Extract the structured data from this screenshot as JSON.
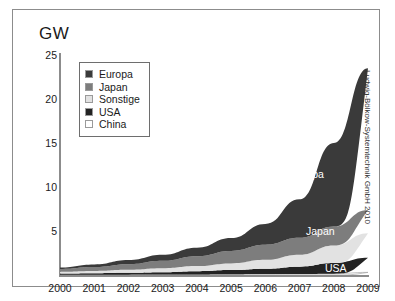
{
  "unit_label": "GW",
  "credit": "Ludwig-Bölkow-Systemtechnik GmbH 2010",
  "legend": {
    "items": [
      {
        "label": "Europa",
        "color": "#3a3a3a"
      },
      {
        "label": "Japan",
        "color": "#7d7d7d"
      },
      {
        "label": "Sonstige",
        "color": "#e2e2e2"
      },
      {
        "label": "USA",
        "color": "#232323"
      },
      {
        "label": "China",
        "color": "#ffffff"
      }
    ]
  },
  "inline_labels": {
    "europa": "Europa",
    "japan": "Japan",
    "usa": "USA"
  },
  "axis": {
    "y_ticks": [
      "25",
      "20",
      "15",
      "10",
      "5"
    ],
    "x_ticks": [
      "2000",
      "2001",
      "2002",
      "2003",
      "2004",
      "2005",
      "2006",
      "2007",
      "2008",
      "2009"
    ]
  },
  "chart_data": {
    "type": "area",
    "stacked": true,
    "title": "",
    "subtitle": "",
    "xlabel": "",
    "ylabel": "GW",
    "ylim": [
      0,
      25
    ],
    "xlim": [
      "2000",
      "2009"
    ],
    "grid": false,
    "legend_position": "inside-top-left",
    "annotations": [
      "Europa",
      "Japan",
      "USA",
      "Ludwig-Bölkow-Systemtechnik GmbH 2010"
    ],
    "categories": [
      "2000",
      "2001",
      "2002",
      "2003",
      "2004",
      "2005",
      "2006",
      "2007",
      "2008",
      "2009"
    ],
    "stack_order_bottom_to_top": [
      "China",
      "USA",
      "Sonstige",
      "Japan",
      "Europa"
    ],
    "series": [
      {
        "name": "China",
        "color": "#ffffff",
        "values": [
          0.02,
          0.03,
          0.04,
          0.05,
          0.06,
          0.08,
          0.1,
          0.12,
          0.15,
          0.3
        ]
      },
      {
        "name": "USA",
        "color": "#232323",
        "values": [
          0.14,
          0.17,
          0.21,
          0.27,
          0.37,
          0.48,
          0.62,
          0.83,
          1.2,
          1.65
        ]
      },
      {
        "name": "Sonstige",
        "color": "#e2e2e2",
        "values": [
          0.2,
          0.26,
          0.34,
          0.44,
          0.58,
          0.76,
          1.0,
          1.35,
          2.0,
          2.8
        ]
      },
      {
        "name": "Japan",
        "color": "#7d7d7d",
        "values": [
          0.33,
          0.45,
          0.64,
          0.86,
          1.13,
          1.42,
          1.71,
          1.92,
          2.15,
          2.65
        ]
      },
      {
        "name": "Europa",
        "color": "#3a3a3a",
        "values": [
          0.16,
          0.29,
          0.47,
          0.68,
          0.96,
          1.46,
          2.37,
          4.38,
          9.5,
          16.1
        ]
      }
    ],
    "totals": [
      0.85,
      1.2,
      1.7,
      2.3,
      3.1,
      4.2,
      5.8,
      8.6,
      15.0,
      23.5
    ]
  }
}
